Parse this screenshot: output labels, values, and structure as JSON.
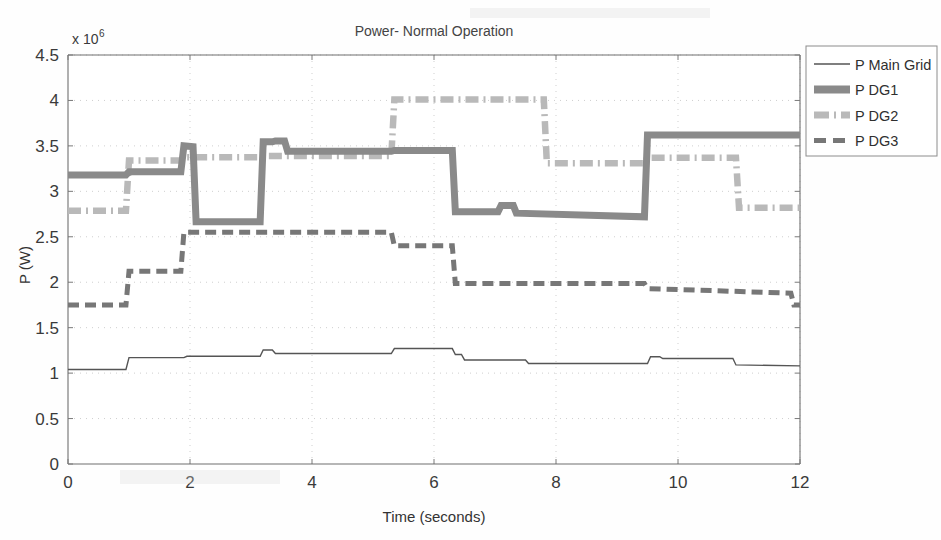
{
  "figure": {
    "title": "Power- Normal Operation",
    "background_color": "#fefefe",
    "axis_color": "#6f6f6f"
  },
  "axes": {
    "y_label": "P (W)",
    "y_exponent_prefix": "x 10",
    "y_exponent_power": "6",
    "x_label": "Time (seconds)",
    "x_ticks": [
      "0",
      "2",
      "4",
      "6",
      "8",
      "10",
      "12"
    ],
    "y_ticks": [
      "0",
      "0.5",
      "1",
      "1.5",
      "2",
      "2.5",
      "3",
      "3.5",
      "4",
      "4.5"
    ]
  },
  "legend": {
    "position": "top-right",
    "entries": [
      {
        "label": "P Main Grid",
        "style": "solid-thin",
        "color": "#555555"
      },
      {
        "label": "P DG1",
        "style": "solid-thick",
        "color": "#8a8a8a"
      },
      {
        "label": "P DG2",
        "style": "dash-dot-thick",
        "color": "#b9b9b9"
      },
      {
        "label": "P DG3",
        "style": "dashed",
        "color": "#777777"
      }
    ]
  },
  "chart_data": {
    "type": "line",
    "title": "Power- Normal Operation",
    "xlabel": "Time (seconds)",
    "ylabel": "P (W)",
    "y_scale_exponent": 6,
    "xlim": [
      0,
      12
    ],
    "ylim": [
      0,
      4500000
    ],
    "grid": "dotted",
    "legend_position": "upper right",
    "interpolation": "step-post",
    "series": [
      {
        "name": "P Main Grid",
        "color": "#555555",
        "linestyle": "solid",
        "linewidth": 1.4,
        "x": [
          0,
          0.95,
          1.0,
          1.9,
          1.95,
          3.15,
          3.2,
          3.35,
          3.4,
          5.3,
          5.35,
          6.3,
          6.35,
          6.45,
          6.5,
          7.5,
          7.55,
          9.5,
          9.55,
          9.7,
          9.75,
          10.9,
          10.95,
          12.0
        ],
        "y": [
          1040000,
          1040000,
          1170000,
          1170000,
          1185000,
          1185000,
          1255000,
          1255000,
          1215000,
          1215000,
          1270000,
          1270000,
          1205000,
          1205000,
          1145000,
          1145000,
          1105000,
          1105000,
          1180000,
          1180000,
          1160000,
          1160000,
          1090000,
          1080000
        ]
      },
      {
        "name": "P DG1",
        "color": "#8a8a8a",
        "linestyle": "solid",
        "linewidth": 7,
        "x": [
          0,
          0.95,
          1.0,
          1.85,
          1.9,
          2.05,
          2.1,
          3.15,
          3.2,
          3.35,
          3.4,
          3.55,
          3.6,
          5.3,
          5.35,
          6.3,
          6.35,
          7.05,
          7.1,
          7.3,
          7.35,
          9.45,
          9.5,
          12.0
        ],
        "y": [
          3180000,
          3180000,
          3215000,
          3215000,
          3500000,
          3490000,
          2665000,
          2665000,
          3545000,
          3545000,
          3555000,
          3555000,
          3440000,
          3440000,
          3450000,
          3450000,
          2775000,
          2775000,
          2845000,
          2845000,
          2760000,
          2720000,
          3620000,
          3620000
        ]
      },
      {
        "name": "P DG2",
        "color": "#b9b9b9",
        "linestyle": "dashdot",
        "linewidth": 6.5,
        "x": [
          0,
          0.95,
          1.0,
          1.85,
          1.9,
          3.15,
          3.2,
          5.3,
          5.35,
          7.8,
          7.85,
          9.45,
          9.5,
          10.95,
          11.0,
          12.0
        ],
        "y": [
          2785000,
          2785000,
          3340000,
          3340000,
          3375000,
          3375000,
          3390000,
          3390000,
          4010000,
          4010000,
          3310000,
          3310000,
          3370000,
          3370000,
          2820000,
          2820000
        ]
      },
      {
        "name": "P DG3",
        "color": "#777777",
        "linestyle": "dashed",
        "linewidth": 5,
        "x": [
          0,
          0.95,
          1.0,
          1.85,
          1.9,
          5.3,
          5.35,
          6.3,
          6.35,
          9.45,
          9.5,
          11.85,
          11.9,
          12.0
        ],
        "y": [
          1750000,
          1750000,
          2120000,
          2120000,
          2550000,
          2550000,
          2400000,
          2400000,
          1985000,
          1985000,
          1930000,
          1880000,
          1750000,
          1750000
        ]
      }
    ]
  }
}
